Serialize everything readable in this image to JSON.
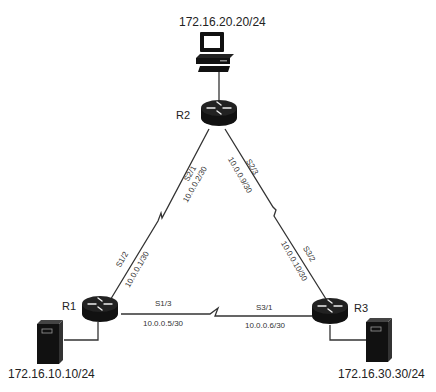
{
  "diagram": {
    "type": "network-topology",
    "routers": [
      {
        "id": "R1",
        "label": "R1"
      },
      {
        "id": "R2",
        "label": "R2"
      },
      {
        "id": "R3",
        "label": "R3"
      }
    ],
    "hosts": [
      {
        "id": "pc",
        "type": "workstation",
        "label": "172.16.20.20/24",
        "attached_to": "R2"
      },
      {
        "id": "srv1",
        "type": "server",
        "label": "172.16.10.10/24",
        "attached_to": "R1"
      },
      {
        "id": "srv3",
        "type": "server",
        "label": "172.16.30.30/24",
        "attached_to": "R3"
      }
    ],
    "links": [
      {
        "from": "R1",
        "to": "R2",
        "type": "serial",
        "r1_if": "S1/2",
        "r1_ip": "10.0.0.1/30",
        "r2_if": "S2/1",
        "r2_ip": "10.0.0.2/30"
      },
      {
        "from": "R2",
        "to": "R3",
        "type": "serial",
        "r2_if": "S2/3",
        "r2_ip": "10.0.0.9/30",
        "r3_if": "S3/2",
        "r3_ip": "10.0.0.10/30"
      },
      {
        "from": "R1",
        "to": "R3",
        "type": "serial",
        "r1_if": "S1/3",
        "r1_ip": "10.0.0.5/30",
        "r3_if": "S3/1",
        "r3_ip": "10.0.0.6/30"
      }
    ]
  }
}
